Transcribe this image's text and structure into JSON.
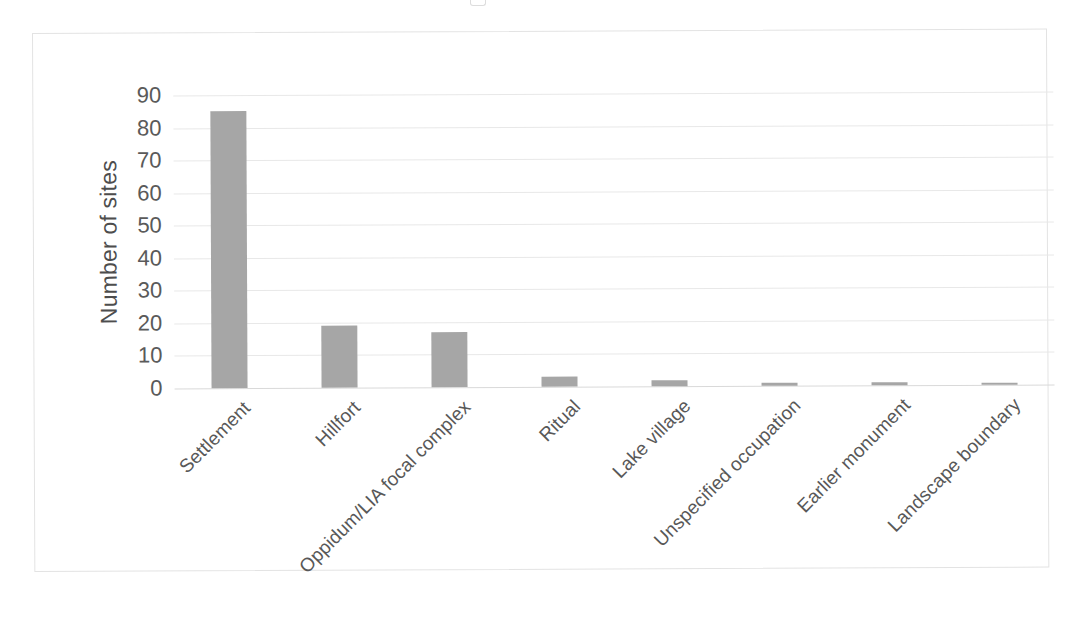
{
  "figure": {
    "background_color": "#ffffff",
    "frame_color": "#e3e3e3",
    "bar_color": "#a6a6a6",
    "gridline_color": "#e8e8e8",
    "axis_text_color": "#5a5a5a"
  },
  "chart_data": {
    "type": "bar",
    "title": "",
    "xlabel": "",
    "ylabel": "Number of sites",
    "ylim": [
      0,
      90
    ],
    "yticks": [
      0,
      10,
      20,
      30,
      40,
      50,
      60,
      70,
      80,
      90
    ],
    "ytick_labels": [
      "0",
      "10",
      "20",
      "30",
      "40",
      "50",
      "60",
      "70",
      "80",
      "90"
    ],
    "grid": true,
    "legend": false,
    "legend_position": "none",
    "orientation": "vertical",
    "categories": [
      "Settlement",
      "Hillfort",
      "Oppidum/LIA focal complex",
      "Ritual",
      "Lake village",
      "Unspecified occupation",
      "Earlier monument",
      "Landscape boundary"
    ],
    "values": [
      85,
      19,
      17,
      3,
      2,
      1,
      1,
      0.5
    ]
  }
}
